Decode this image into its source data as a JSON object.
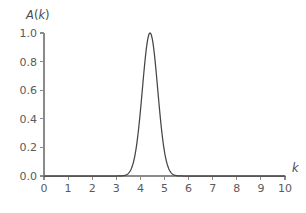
{
  "figure": {
    "background_color": "#ffffff",
    "curve_color": "#454545",
    "axis_color": "#8a8a8a",
    "text_color": "#5a5a5a"
  },
  "labels": {
    "ylabel_main": "A",
    "ylabel_paren_open": "(",
    "ylabel_var": "k",
    "ylabel_paren_close": ")",
    "ylabel_full": "A(k)",
    "xlabel": "k"
  },
  "chart_data": {
    "type": "line",
    "title": "",
    "xlabel": "k",
    "ylabel": "A(k)",
    "xlim": [
      0,
      10
    ],
    "ylim": [
      0.0,
      1.0
    ],
    "grid": false,
    "legend": false,
    "xticks": [
      0,
      1,
      2,
      3,
      4,
      5,
      6,
      7,
      8,
      9,
      10
    ],
    "xticklabels": [
      "0",
      "1",
      "2",
      "3",
      "4",
      "5",
      "6",
      "7",
      "8",
      "9",
      "10"
    ],
    "yticks": [
      0.0,
      0.2,
      0.4,
      0.6,
      0.8,
      1.0
    ],
    "yticklabels": [
      "0.0",
      "0.2",
      "0.4",
      "0.6",
      "0.8",
      "1.0"
    ],
    "peak": {
      "x": 4.4,
      "y": 1.0
    },
    "fwhm": 0.75,
    "series": [
      {
        "name": "A(k)",
        "color": "#454545",
        "x": [
          0.0,
          0.25,
          0.5,
          0.75,
          1.0,
          1.25,
          1.5,
          1.75,
          2.0,
          2.25,
          2.5,
          2.75,
          3.0,
          3.1,
          3.2,
          3.3,
          3.4,
          3.5,
          3.6,
          3.7,
          3.8,
          3.9,
          4.0,
          4.1,
          4.2,
          4.3,
          4.4,
          4.5,
          4.6,
          4.7,
          4.8,
          4.9,
          5.0,
          5.1,
          5.2,
          5.3,
          5.4,
          5.5,
          5.6,
          5.7,
          5.8,
          5.9,
          6.0,
          6.25,
          6.5,
          6.75,
          7.0,
          7.5,
          8.0,
          8.5,
          9.0,
          9.5,
          10.0
        ],
        "y": [
          0.0,
          0.0,
          0.0,
          0.0,
          0.0,
          0.0,
          0.0,
          0.0,
          0.0,
          0.0,
          0.0,
          0.0,
          0.001,
          0.003,
          0.007,
          0.018,
          0.041,
          0.086,
          0.164,
          0.283,
          0.441,
          0.618,
          0.781,
          0.901,
          0.974,
          1.0,
          1.0,
          0.974,
          0.901,
          0.781,
          0.618,
          0.441,
          0.283,
          0.164,
          0.086,
          0.041,
          0.018,
          0.007,
          0.003,
          0.001,
          0.0,
          0.0,
          0.0,
          0.0,
          0.0,
          0.0,
          0.0,
          0.0,
          0.0,
          0.0,
          0.0,
          0.0,
          0.0
        ]
      }
    ]
  },
  "geometry": {
    "plot_left": 44,
    "plot_right": 285,
    "plot_top": 33,
    "plot_bottom": 176,
    "tick_length": 4
  }
}
